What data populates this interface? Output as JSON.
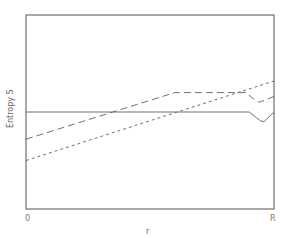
{
  "chart_data": {
    "type": "line",
    "title": "",
    "xlabel": "r",
    "ylabel": "Entropy S",
    "x_tick_labels": [
      "0",
      "R"
    ],
    "xlim": [
      0,
      1
    ],
    "ylim": [
      0,
      1
    ],
    "grid": false,
    "legend": null,
    "series": [
      {
        "name": "solid",
        "style": "solid",
        "x": [
          0.0,
          0.9,
          0.93,
          0.96,
          1.0
        ],
        "y": [
          0.5,
          0.5,
          0.47,
          0.45,
          0.5
        ]
      },
      {
        "name": "long-dash",
        "style": "long-dash",
        "x": [
          0.0,
          0.6,
          0.89,
          0.94,
          1.0
        ],
        "y": [
          0.36,
          0.6,
          0.6,
          0.55,
          0.58
        ]
      },
      {
        "name": "short-dash",
        "style": "short-dash",
        "x": [
          0.0,
          1.0
        ],
        "y": [
          0.25,
          0.66
        ]
      }
    ]
  },
  "axes": {
    "x_label": "r",
    "y_label": "Entropy S",
    "x_ticks": [
      "0",
      "R"
    ]
  },
  "colors": {
    "frame": "#6e6e6e",
    "lines": "#707070",
    "text": "#777777"
  }
}
